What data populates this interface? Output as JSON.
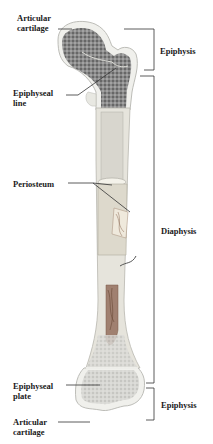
{
  "diagram": {
    "left_labels": {
      "articular_cartilage_top": [
        "Articular",
        "cartilage"
      ],
      "epiphyseal_line": [
        "Epiphyseal",
        "line"
      ],
      "periosteum": "Periosteum",
      "epiphyseal_plate": [
        "Epiphyseal",
        "plate"
      ],
      "articular_cartilage_bottom": [
        "Articular",
        "cartilage"
      ]
    },
    "right_labels": {
      "epiphysis_top": "Epiphysis",
      "diaphysis": "Diaphysis",
      "epiphysis_bottom": "Epiphysis"
    },
    "colors": {
      "background": "#ffffff",
      "text": "#1a1a1a",
      "line": "#333333",
      "cartilage": "#f2f2ee",
      "spongy_bone": "#6e6e6e",
      "compact_bone": "#e6e4dc",
      "marrow": "#8a6a55"
    }
  }
}
